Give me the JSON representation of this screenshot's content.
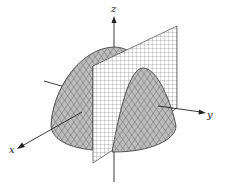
{
  "figure": {
    "axes": {
      "x": {
        "label": "x"
      },
      "y": {
        "label": "y"
      },
      "z": {
        "label": "z"
      }
    },
    "colors": {
      "surface_fill": "#b8b8b8",
      "surface_mesh": "#3a3a3a",
      "plane_fill": "#ffffff",
      "plane_grid": "#555555",
      "axis": "#222222"
    }
  }
}
